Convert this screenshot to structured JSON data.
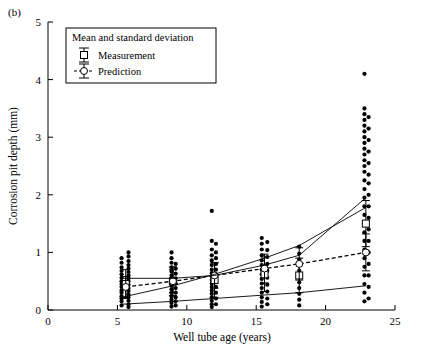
{
  "figure": {
    "panel_label": "(b)"
  },
  "chart_data": {
    "type": "scatter",
    "title": "",
    "xlabel": "Well tube age (years)",
    "ylabel": "Corrosion pit depth (mm)",
    "xlim": [
      0,
      25
    ],
    "ylim": [
      0,
      5
    ],
    "xticks": [
      0,
      5,
      10,
      15,
      20,
      25
    ],
    "yticks": [
      0,
      1,
      2,
      3,
      4,
      5
    ],
    "grid": false,
    "legend": {
      "title": "Mean and standard deviation",
      "position": "upper-left-inside",
      "entries": [
        {
          "name": "Measurement",
          "marker": "errorbar-open-square"
        },
        {
          "name": "Prediction",
          "marker": "errorbar-open-circle-dashed"
        }
      ]
    },
    "series": [
      {
        "name": "Measurement",
        "type": "scatter",
        "marker": "filled-circle",
        "color": "#000000",
        "points": [
          [
            5.3,
            0.08
          ],
          [
            5.3,
            0.15
          ],
          [
            5.3,
            0.2
          ],
          [
            5.3,
            0.24
          ],
          [
            5.3,
            0.3
          ],
          [
            5.3,
            0.34
          ],
          [
            5.3,
            0.4
          ],
          [
            5.3,
            0.45
          ],
          [
            5.3,
            0.5
          ],
          [
            5.3,
            0.56
          ],
          [
            5.3,
            0.62
          ],
          [
            5.3,
            0.68
          ],
          [
            5.3,
            0.74
          ],
          [
            5.3,
            0.82
          ],
          [
            5.3,
            0.9
          ],
          [
            5.8,
            0.05
          ],
          [
            5.8,
            0.1
          ],
          [
            5.8,
            0.16
          ],
          [
            5.8,
            0.22
          ],
          [
            5.8,
            0.27
          ],
          [
            5.8,
            0.33
          ],
          [
            5.8,
            0.38
          ],
          [
            5.8,
            0.44
          ],
          [
            5.8,
            0.5
          ],
          [
            5.8,
            0.55
          ],
          [
            5.8,
            0.6
          ],
          [
            5.8,
            0.66
          ],
          [
            5.8,
            0.72
          ],
          [
            5.8,
            0.78
          ],
          [
            5.8,
            0.85
          ],
          [
            5.8,
            0.93
          ],
          [
            5.8,
            1.0
          ],
          [
            8.9,
            0.06
          ],
          [
            8.9,
            0.12
          ],
          [
            8.9,
            0.18
          ],
          [
            8.9,
            0.24
          ],
          [
            8.9,
            0.3
          ],
          [
            8.9,
            0.36
          ],
          [
            8.9,
            0.42
          ],
          [
            8.9,
            0.48
          ],
          [
            8.9,
            0.54
          ],
          [
            8.9,
            0.6
          ],
          [
            8.9,
            0.67
          ],
          [
            8.9,
            0.74
          ],
          [
            8.9,
            0.82
          ],
          [
            8.9,
            0.9
          ],
          [
            8.9,
            1.0
          ],
          [
            9.2,
            0.08
          ],
          [
            9.2,
            0.15
          ],
          [
            9.2,
            0.22
          ],
          [
            9.2,
            0.3
          ],
          [
            9.2,
            0.38
          ],
          [
            9.2,
            0.46
          ],
          [
            9.2,
            0.55
          ],
          [
            9.2,
            0.63
          ],
          [
            9.2,
            0.72
          ],
          [
            9.2,
            0.8
          ],
          [
            11.8,
            0.05
          ],
          [
            11.8,
            0.1
          ],
          [
            11.8,
            0.16
          ],
          [
            11.8,
            0.22
          ],
          [
            11.8,
            0.28
          ],
          [
            11.8,
            0.34
          ],
          [
            11.8,
            0.4
          ],
          [
            11.8,
            0.46
          ],
          [
            11.8,
            0.52
          ],
          [
            11.8,
            0.58
          ],
          [
            11.8,
            0.64
          ],
          [
            11.8,
            0.7
          ],
          [
            11.8,
            0.78
          ],
          [
            11.8,
            0.86
          ],
          [
            11.8,
            0.95
          ],
          [
            11.8,
            1.05
          ],
          [
            11.8,
            1.2
          ],
          [
            11.8,
            1.72
          ],
          [
            12.1,
            0.1
          ],
          [
            12.1,
            0.2
          ],
          [
            12.1,
            0.3
          ],
          [
            12.1,
            0.4
          ],
          [
            12.1,
            0.5
          ],
          [
            12.1,
            0.6
          ],
          [
            12.1,
            0.7
          ],
          [
            12.1,
            0.8
          ],
          [
            12.1,
            0.9
          ],
          [
            12.1,
            1.0
          ],
          [
            12.1,
            1.15
          ],
          [
            15.4,
            0.06
          ],
          [
            15.4,
            0.14
          ],
          [
            15.4,
            0.22
          ],
          [
            15.4,
            0.3
          ],
          [
            15.4,
            0.38
          ],
          [
            15.4,
            0.46
          ],
          [
            15.4,
            0.54
          ],
          [
            15.4,
            0.62
          ],
          [
            15.4,
            0.7
          ],
          [
            15.4,
            0.78
          ],
          [
            15.4,
            0.86
          ],
          [
            15.4,
            0.95
          ],
          [
            15.4,
            1.05
          ],
          [
            15.4,
            1.15
          ],
          [
            15.4,
            1.25
          ],
          [
            15.8,
            0.1
          ],
          [
            15.8,
            0.2
          ],
          [
            15.8,
            0.32
          ],
          [
            15.8,
            0.44
          ],
          [
            15.8,
            0.56
          ],
          [
            15.8,
            0.68
          ],
          [
            15.8,
            0.8
          ],
          [
            15.8,
            0.92
          ],
          [
            15.8,
            1.04
          ],
          [
            15.8,
            1.18
          ],
          [
            18.1,
            0.08
          ],
          [
            18.1,
            0.18
          ],
          [
            18.1,
            0.28
          ],
          [
            18.1,
            0.38
          ],
          [
            18.1,
            0.48
          ],
          [
            18.1,
            0.58
          ],
          [
            18.1,
            0.68
          ],
          [
            18.1,
            0.78
          ],
          [
            18.1,
            0.88
          ],
          [
            18.1,
            0.98
          ],
          [
            18.1,
            1.1
          ],
          [
            22.8,
            0.15
          ],
          [
            22.8,
            0.3
          ],
          [
            22.8,
            0.45
          ],
          [
            22.8,
            0.6
          ],
          [
            22.8,
            0.75
          ],
          [
            22.8,
            0.9
          ],
          [
            22.8,
            1.05
          ],
          [
            22.8,
            1.2
          ],
          [
            22.8,
            1.35
          ],
          [
            22.8,
            1.5
          ],
          [
            22.8,
            1.65
          ],
          [
            22.8,
            1.8
          ],
          [
            22.8,
            1.95
          ],
          [
            22.8,
            2.1
          ],
          [
            22.8,
            2.25
          ],
          [
            22.8,
            2.4
          ],
          [
            22.8,
            2.5
          ],
          [
            22.8,
            2.6
          ],
          [
            22.8,
            2.7
          ],
          [
            22.8,
            2.8
          ],
          [
            22.8,
            2.9
          ],
          [
            22.8,
            3.0
          ],
          [
            22.8,
            3.1
          ],
          [
            22.8,
            3.2
          ],
          [
            22.8,
            3.3
          ],
          [
            22.8,
            3.4
          ],
          [
            22.8,
            3.5
          ],
          [
            22.8,
            4.1
          ],
          [
            23.1,
            0.2
          ],
          [
            23.1,
            0.4
          ],
          [
            23.1,
            0.6
          ],
          [
            23.1,
            0.8
          ],
          [
            23.1,
            1.0
          ],
          [
            23.1,
            1.2
          ],
          [
            23.1,
            1.4
          ],
          [
            23.1,
            1.6
          ],
          [
            23.1,
            1.8
          ],
          [
            23.1,
            2.0
          ],
          [
            23.1,
            2.2
          ],
          [
            23.1,
            2.35
          ],
          [
            23.1,
            2.55
          ],
          [
            23.1,
            2.75
          ],
          [
            23.1,
            2.95
          ],
          [
            23.1,
            3.15
          ],
          [
            23.1,
            3.35
          ]
        ]
      },
      {
        "name": "Measurement mean ± sd",
        "type": "errorbar",
        "marker": "open-square",
        "points": [
          {
            "x": 5.6,
            "y": 0.45,
            "err": 0.25
          },
          {
            "x": 9.0,
            "y": 0.5,
            "err": 0.25
          },
          {
            "x": 12.0,
            "y": 0.52,
            "err": 0.3
          },
          {
            "x": 15.6,
            "y": 0.62,
            "err": 0.3
          },
          {
            "x": 18.1,
            "y": 0.6,
            "err": 0.3
          },
          {
            "x": 22.9,
            "y": 1.5,
            "err": 0.4
          }
        ]
      },
      {
        "name": "Prediction mean ± sd",
        "type": "errorbar-dashed-line",
        "marker": "open-circle",
        "points": [
          {
            "x": 5.6,
            "y": 0.4,
            "err": 0.18
          },
          {
            "x": 9.0,
            "y": 0.5,
            "err": 0.2
          },
          {
            "x": 12.0,
            "y": 0.6,
            "err": 0.22
          },
          {
            "x": 15.6,
            "y": 0.72,
            "err": 0.25
          },
          {
            "x": 18.1,
            "y": 0.8,
            "err": 0.28
          },
          {
            "x": 22.9,
            "y": 1.0,
            "err": 0.32
          }
        ]
      },
      {
        "name": "Prediction upper bound",
        "type": "line",
        "points": [
          [
            5.3,
            0.22
          ],
          [
            9.0,
            0.42
          ],
          [
            12.0,
            0.62
          ],
          [
            15.6,
            0.9
          ],
          [
            18.1,
            1.12
          ],
          [
            22.9,
            1.78
          ]
        ]
      },
      {
        "name": "Prediction lower bound",
        "type": "line",
        "points": [
          [
            5.3,
            0.1
          ],
          [
            9.0,
            0.15
          ],
          [
            12.0,
            0.2
          ],
          [
            15.6,
            0.26
          ],
          [
            18.1,
            0.3
          ],
          [
            22.9,
            0.42
          ]
        ]
      },
      {
        "name": "Measurement upper envelope",
        "type": "line",
        "points": [
          [
            5.3,
            0.55
          ],
          [
            9.0,
            0.55
          ],
          [
            12.0,
            0.6
          ],
          [
            15.6,
            0.78
          ],
          [
            18.1,
            0.95
          ],
          [
            22.9,
            1.95
          ]
        ]
      }
    ]
  }
}
